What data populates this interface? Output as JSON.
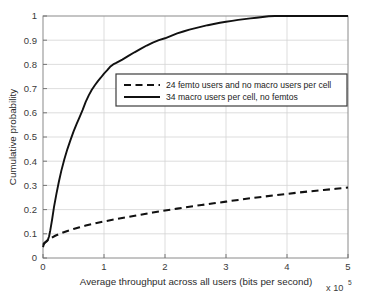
{
  "chart_data": {
    "type": "line",
    "title": "",
    "xlabel": "Average throughput across all users (bits per second)",
    "ylabel": "Cumulative probability",
    "x_multiplier": "x 10",
    "x_multiplier_exponent": "5",
    "xlim": [
      0,
      5
    ],
    "ylim": [
      0,
      1
    ],
    "xticks": [
      "0",
      "1",
      "2",
      "3",
      "4",
      "5"
    ],
    "yticks": [
      "0",
      "0.1",
      "0.2",
      "0.3",
      "0.4",
      "0.5",
      "0.6",
      "0.7",
      "0.8",
      "0.9",
      "1"
    ],
    "grid": true,
    "legend_position": "center",
    "series": [
      {
        "name": "24 femto users and no macro users per cell",
        "style": "dashed",
        "color": "#111111",
        "x": [
          0,
          0.05,
          0.1,
          0.2,
          0.3,
          0.4,
          0.5,
          0.6,
          0.7,
          0.8,
          0.9,
          1.0,
          1.2,
          1.4,
          1.6,
          1.8,
          2.0,
          2.2,
          2.4,
          2.6,
          2.8,
          3.0,
          3.2,
          3.4,
          3.6,
          3.8,
          4.0,
          4.2,
          4.4,
          4.6,
          4.8,
          5.0
        ],
        "y": [
          0.055,
          0.068,
          0.078,
          0.092,
          0.103,
          0.112,
          0.12,
          0.127,
          0.134,
          0.14,
          0.146,
          0.151,
          0.161,
          0.17,
          0.179,
          0.188,
          0.196,
          0.204,
          0.212,
          0.219,
          0.226,
          0.233,
          0.24,
          0.247,
          0.253,
          0.259,
          0.265,
          0.271,
          0.276,
          0.281,
          0.286,
          0.291
        ]
      },
      {
        "name": "34 macro users per cell, no femtos",
        "style": "solid",
        "color": "#111111",
        "x": [
          0,
          0.02,
          0.04,
          0.06,
          0.08,
          0.1,
          0.12,
          0.15,
          0.18,
          0.22,
          0.26,
          0.3,
          0.35,
          0.4,
          0.45,
          0.5,
          0.55,
          0.6,
          0.65,
          0.7,
          0.75,
          0.8,
          0.85,
          0.9,
          0.95,
          1.0,
          1.05,
          1.1,
          1.15,
          1.2,
          1.3,
          1.4,
          1.5,
          1.6,
          1.7,
          1.8,
          1.9,
          2.0,
          2.1,
          2.2,
          2.3,
          2.4,
          2.5,
          2.6,
          2.7,
          2.8,
          2.9,
          3.0,
          3.1,
          3.2,
          3.3,
          3.4,
          3.5,
          3.6,
          3.7,
          3.8,
          4.0,
          4.5,
          5.0
        ],
        "y": [
          0.045,
          0.062,
          0.065,
          0.068,
          0.075,
          0.09,
          0.115,
          0.16,
          0.21,
          0.265,
          0.315,
          0.36,
          0.408,
          0.45,
          0.487,
          0.522,
          0.553,
          0.582,
          0.612,
          0.645,
          0.672,
          0.695,
          0.714,
          0.731,
          0.746,
          0.762,
          0.775,
          0.79,
          0.8,
          0.806,
          0.82,
          0.835,
          0.85,
          0.864,
          0.878,
          0.89,
          0.9,
          0.908,
          0.918,
          0.928,
          0.936,
          0.944,
          0.95,
          0.956,
          0.962,
          0.967,
          0.972,
          0.976,
          0.98,
          0.984,
          0.987,
          0.99,
          0.993,
          0.996,
          0.999,
          1.0,
          1.0,
          1.0,
          1.0
        ]
      }
    ]
  }
}
